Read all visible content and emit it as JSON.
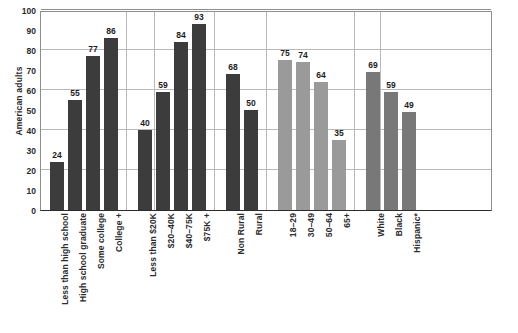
{
  "chart_data": {
    "type": "bar",
    "title": "",
    "xlabel": "",
    "ylabel": "American adults",
    "ylim": [
      0,
      100
    ],
    "ytick_step": 10,
    "gridline_step": 20,
    "grid": true,
    "legend": "none",
    "ytick_labels": [
      "0",
      "10",
      "20",
      "30",
      "40",
      "50",
      "60",
      "70",
      "80",
      "90",
      "100"
    ],
    "groups": [
      {
        "name": "Education",
        "color": "#3c3c3c",
        "categories": [
          "Less than high school",
          "High school graduate",
          "Some college",
          "College +"
        ],
        "values": [
          24,
          55,
          77,
          86
        ]
      },
      {
        "name": "Income",
        "color": "#3c3c3c",
        "categories": [
          "Less than $20K",
          "$20–40K",
          "$40–75K",
          "$75K +"
        ],
        "values": [
          40,
          59,
          84,
          93
        ]
      },
      {
        "name": "Rural",
        "color": "#3c3c3c",
        "categories": [
          "Non Rural",
          "Rural"
        ],
        "values": [
          68,
          50
        ]
      },
      {
        "name": "Age",
        "color": "#9a9a9a",
        "categories": [
          "18–29",
          "30–49",
          "50–64",
          "65+"
        ],
        "values": [
          75,
          74,
          64,
          35
        ]
      },
      {
        "name": "Race",
        "color": "#787878",
        "categories": [
          "White",
          "Black",
          "Hispanic*"
        ],
        "values": [
          69,
          59,
          49
        ]
      }
    ],
    "categories": [
      "Less than high school",
      "High school graduate",
      "Some college",
      "College +",
      "Less than $20K",
      "$20–40K",
      "$40–75K",
      "$75K +",
      "Non Rural",
      "Rural",
      "18–29",
      "30–49",
      "50–64",
      "65+",
      "White",
      "Black",
      "Hispanic*"
    ],
    "values": [
      24,
      55,
      77,
      86,
      40,
      59,
      84,
      93,
      68,
      50,
      75,
      74,
      64,
      35,
      69,
      59,
      49
    ]
  }
}
